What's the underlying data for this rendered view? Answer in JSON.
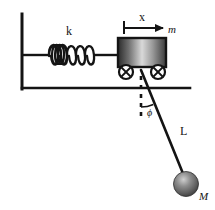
{
  "figure": {
    "labels": {
      "spring_constant": "k",
      "displacement": "x",
      "cart_mass": "m",
      "angle": "ϕ",
      "rod_length": "L",
      "bob_mass": "M"
    },
    "colors": {
      "stroke": "#141414",
      "cart_dark": "#2b2b2b",
      "cart_light": "#d9d9d9",
      "ball_light": "#bdbdbd",
      "ball_dark": "#4a4a4a",
      "background": "#ffffff"
    },
    "geometry": {
      "wall_x": 22,
      "wall_top_y": 14,
      "ground_y": 88,
      "ground_right_x": 190,
      "spring_coils": 5,
      "spring_start_x": 48,
      "spring_end_x": 96,
      "spring_axis_y": 55,
      "cart_left": 118,
      "cart_right": 166,
      "cart_top": 38,
      "cart_bottom": 67,
      "wheel_radius": 7,
      "wheel_left_cx": 126,
      "wheel_right_cx": 158,
      "wheel_cy": 72,
      "pivot_x": 141,
      "pivot_y": 70,
      "bob_cx": 186,
      "bob_cy": 184,
      "bob_r": 12,
      "dashed_vertical_bottom": 120,
      "arrow_start_x": 124,
      "arrow_end_x": 166,
      "arrow_y": 28,
      "angle_arc_radius": 30
    }
  }
}
